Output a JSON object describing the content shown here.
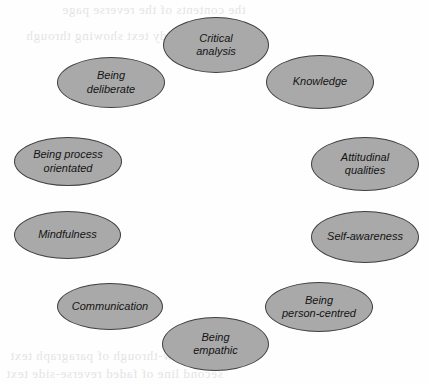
{
  "diagram": {
    "type": "circular-concept-map",
    "node_fill_color": "#a9a9a9",
    "node_border_color": "#3f3f3f",
    "text_color": "#141414",
    "background_color": "#ffffff",
    "nodes": [
      {
        "id": "critical-analysis",
        "label": "Critical\nanalysis",
        "x": 163,
        "y": 17,
        "w": 106,
        "h": 56
      },
      {
        "id": "knowledge",
        "label": "Knowledge",
        "x": 266,
        "y": 55,
        "w": 108,
        "h": 54
      },
      {
        "id": "attitudinal-qualities",
        "label": "Attitudinal\nqualities",
        "x": 311,
        "y": 137,
        "w": 108,
        "h": 54
      },
      {
        "id": "self-awareness",
        "label": "Self-awareness",
        "x": 311,
        "y": 211,
        "w": 108,
        "h": 52
      },
      {
        "id": "being-person-centred",
        "label": "Being\nperson-centred",
        "x": 265,
        "y": 282,
        "w": 108,
        "h": 50
      },
      {
        "id": "being-empathic",
        "label": "Being\nempathic",
        "x": 162,
        "y": 317,
        "w": 107,
        "h": 54
      },
      {
        "id": "communication",
        "label": "Communication",
        "x": 57,
        "y": 283,
        "w": 106,
        "h": 47
      },
      {
        "id": "mindfulness",
        "label": "Mindfulness",
        "x": 14,
        "y": 211,
        "w": 107,
        "h": 48
      },
      {
        "id": "being-process-orientated",
        "label": "Being process\norientated",
        "x": 14,
        "y": 137,
        "w": 108,
        "h": 49
      },
      {
        "id": "being-deliberate",
        "label": "Being\ndeliberate",
        "x": 57,
        "y": 57,
        "w": 108,
        "h": 51
      }
    ]
  },
  "background_bleed": {
    "description": "faint illegible show-through text from the reverse side of the scanned page",
    "lines": [
      {
        "text": "the contents of the reverse page",
        "x": 62,
        "y": 2,
        "size": 13
      },
      {
        "text": "faint mirrored body text showing through",
        "x": 26,
        "y": 28,
        "size": 13
      },
      {
        "text": "illegible show-through of paragraph text",
        "x": 10,
        "y": 348,
        "size": 13
      },
      {
        "text": "second line of faded reverse-side text",
        "x": 6,
        "y": 366,
        "size": 13
      }
    ]
  }
}
